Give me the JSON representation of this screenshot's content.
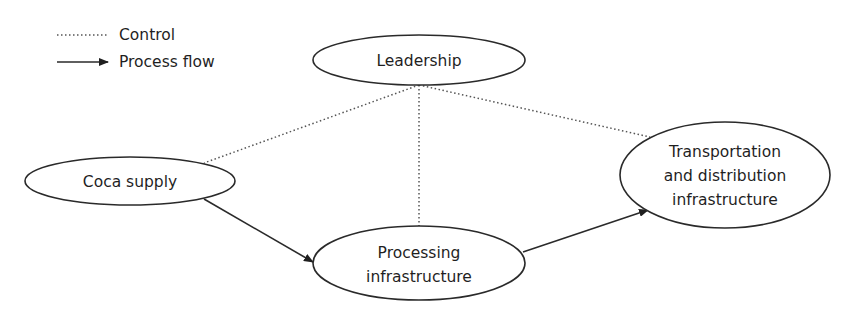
{
  "legend": {
    "control_label": "Control",
    "process_flow_label": "Process flow"
  },
  "nodes": {
    "leadership": {
      "label": "Leadership"
    },
    "coca_supply": {
      "label": "Coca supply"
    },
    "processing": {
      "lines": [
        "Processing",
        "infrastructure"
      ]
    },
    "transportation": {
      "lines": [
        "Transportation",
        "and distribution",
        "infrastructure"
      ]
    }
  },
  "edges": [
    {
      "from": "Leadership",
      "to": "Coca supply",
      "type": "control"
    },
    {
      "from": "Leadership",
      "to": "Processing infrastructure",
      "type": "control"
    },
    {
      "from": "Leadership",
      "to": "Transportation and distribution infrastructure",
      "type": "control"
    },
    {
      "from": "Coca supply",
      "to": "Processing infrastructure",
      "type": "process flow"
    },
    {
      "from": "Processing infrastructure",
      "to": "Transportation and distribution infrastructure",
      "type": "process flow"
    }
  ],
  "colors": {
    "stroke": "#2a2a2a",
    "text": "#1f1f1f",
    "background": "#ffffff"
  }
}
